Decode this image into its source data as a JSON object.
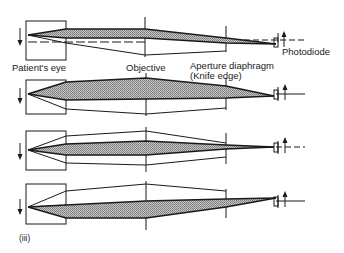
{
  "figure": {
    "labels": {
      "patients_eye": "Patient's eye",
      "objective": "Objective",
      "aperture_line1": "Aperture diaphragm",
      "aperture_line2": "(Knife edge)",
      "photodiode": "Photodiode",
      "panel_label": "(iii)"
    },
    "colors": {
      "stroke": "#1a1a1a",
      "hatch_fill": "#a8a8a8",
      "background": "#ffffff"
    },
    "panels": [
      {
        "index": 1,
        "eye_box_y": [
          21,
          60
        ],
        "axis_y": 35,
        "shaded": "upper beam converging to knife edge"
      },
      {
        "index": 2,
        "eye_box_y": [
          80,
          114
        ],
        "axis_y": 94,
        "shaded": "upper wide beam"
      },
      {
        "index": 3,
        "eye_box_y": [
          131,
          170
        ],
        "axis_y": 150,
        "shaded": "central symmetric beam"
      },
      {
        "index": 4,
        "eye_box_y": [
          184,
          224
        ],
        "axis_y": 207,
        "shaded": "lower beam"
      }
    ]
  }
}
